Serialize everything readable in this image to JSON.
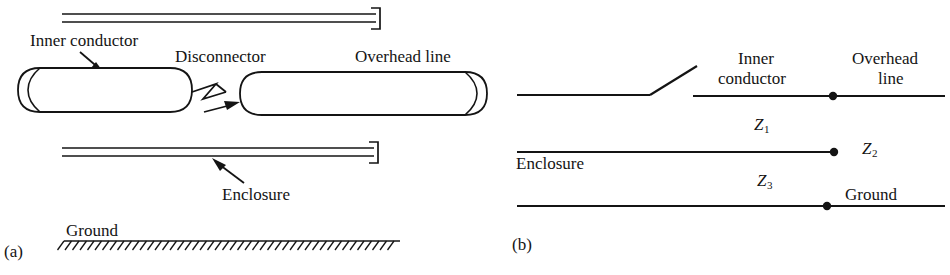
{
  "figure": {
    "stroke_color": "#141414",
    "background_color": "#ffffff",
    "panels": [
      {
        "caption": "(a)",
        "description": "physical cross-section of coaxial GIS bus with disconnector"
      },
      {
        "caption": "(b)",
        "description": "equivalent transmission-line circuit with surge impedances"
      }
    ]
  },
  "panel_a": {
    "caption": "(a)",
    "labels": {
      "inner_conductor": "Inner conductor",
      "disconnector": "Disconnector",
      "overhead_line": "Overhead line",
      "enclosure": "Enclosure",
      "ground": "Ground"
    },
    "parts": {
      "top_enclosure_wall": "top enclosure wall (double line with end terminator)",
      "left_cylinder": "left inner conductor cylinder",
      "right_cylinder": "right inner conductor cylinder toward overhead line",
      "gap_symbol": "zigzag spark gap between cylinders",
      "bottom_enclosure_wall": "bottom enclosure wall (double line with end terminator)",
      "ground_hatch": "hatched ground plane"
    }
  },
  "panel_b": {
    "caption": "(b)",
    "labels": {
      "inner_conductor_line1": "Inner",
      "inner_conductor_line2": "conductor",
      "overhead_line_line1": "Overhead",
      "overhead_line_line2": "line",
      "enclosure": "Enclosure",
      "ground": "Ground"
    },
    "impedances": [
      {
        "name": "Z",
        "subscript": "1",
        "meaning": "inner conductor to enclosure surge impedance"
      },
      {
        "name": "Z",
        "subscript": "2",
        "meaning": "enclosure to ground surge impedance"
      },
      {
        "name": "Z",
        "subscript": "3",
        "meaning": "ground return surge impedance"
      }
    ],
    "parts": {
      "open_switch": "open disconnector switch (hinged blade)",
      "node_top": "junction node on inner conductor line",
      "node_middle": "junction node at enclosure line end",
      "node_bottom": "junction node on ground line"
    }
  }
}
